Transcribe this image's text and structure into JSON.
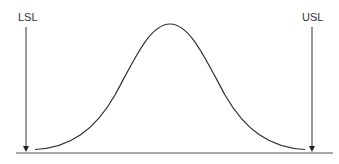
{
  "diagram": {
    "type": "process-capability-normal-curve",
    "labels": {
      "lower_spec_limit": "LSL",
      "upper_spec_limit": "USL"
    },
    "colors": {
      "stroke": "#333333",
      "background": "#ffffff"
    }
  }
}
